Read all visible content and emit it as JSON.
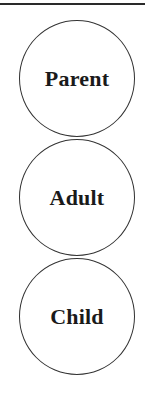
{
  "diagram": {
    "type": "vertical-stack-of-circles",
    "nodes": [
      {
        "label": "Parent"
      },
      {
        "label": "Adult"
      },
      {
        "label": "Child"
      }
    ],
    "colors": {
      "stroke": "#333333",
      "text": "#1a1a1a",
      "background": "#ffffff"
    }
  }
}
